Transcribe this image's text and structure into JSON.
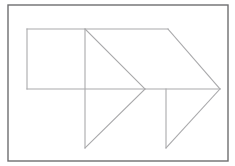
{
  "figure": {
    "canvas": {
      "width": 235,
      "height": 166,
      "background": "#ffffff"
    },
    "frame": {
      "name": "outer-frame",
      "x": 8,
      "y": 5,
      "width": 220,
      "height": 156,
      "stroke": "#6e6e70",
      "stroke_width": 1.4,
      "fill": "#ffffff"
    },
    "stroke_color": "#a9a9ab",
    "stroke_width": 1.1,
    "key_points": {
      "rect_top_left": [
        27,
        29
      ],
      "rect_top_right": [
        85,
        29
      ],
      "rect_bottom_right": [
        85,
        89
      ],
      "rect_bottom_left": [
        27,
        89
      ],
      "top_edge_right_end": [
        168,
        29
      ],
      "arrow_tip_outer": [
        220,
        89
      ],
      "inner_chevron_tip": [
        145,
        89
      ],
      "left_triangle_bottom": [
        85,
        148
      ],
      "right_triangle_top": [
        166,
        89
      ],
      "right_triangle_bottom": [
        166,
        148
      ]
    },
    "paths": [
      {
        "name": "rectangle-and-top-edge",
        "d": "M 27 29 L 168 29",
        "role": "top horizontal edge spanning rectangle and upper arrow"
      },
      {
        "name": "rectangle-left-edge",
        "d": "M 27 29 L 27 89",
        "role": "left side of rectangle"
      },
      {
        "name": "median-horizontal-edge",
        "d": "M 27 89 L 220 89",
        "role": "long horizontal center line ending at arrow tip"
      },
      {
        "name": "outer-arrow-upper-diagonal",
        "d": "M 168 29 L 220 89",
        "role": "upper slanted edge of the large arrow head"
      },
      {
        "name": "outer-arrow-lower-diagonal",
        "d": "M 220 89 L 166 148",
        "role": "lower slanted edge of the large arrow head"
      },
      {
        "name": "right-triangle-vertical",
        "d": "M 166 89 L 166 148",
        "role": "vertical leg of lower right triangle"
      },
      {
        "name": "center-vertical",
        "d": "M 85 29 L 85 148",
        "role": "tall vertical line through rectangle and lower triangle"
      },
      {
        "name": "inner-chevron-upper",
        "d": "M 85 29 L 145 89",
        "role": "upper slanted edge of inner chevron"
      },
      {
        "name": "inner-chevron-lower",
        "d": "M 145 89 L 85 148",
        "role": "lower slanted edge of inner chevron"
      }
    ]
  }
}
